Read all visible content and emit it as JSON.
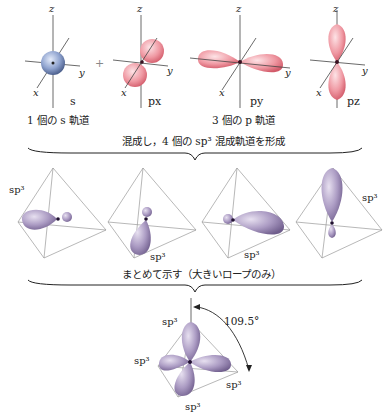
{
  "top_row": {
    "s_label": "s",
    "px_label": "px",
    "py_label": "py",
    "pz_label": "pz",
    "plus": "+",
    "axis_x": "x",
    "axis_y": "y",
    "axis_z": "z",
    "s_caption": "1 個の s 軌道",
    "p_caption": "3 個の p 軌道"
  },
  "brace1_caption": "混成し，4 個の sp³ 混成軌道を形成",
  "middle_row": {
    "labels": [
      "sp³",
      "sp³",
      "sp³",
      "sp³"
    ]
  },
  "brace2_caption": "まとめて示す（大きいロープのみ）",
  "bottom": {
    "labels": [
      "sp³",
      "sp³",
      "sp³",
      "sp³"
    ],
    "angle": "109.5°"
  },
  "colors": {
    "s_orbital": "#8fa3cf",
    "p_orbital": "#e9808c",
    "sp3_orbital": "#a595bd",
    "nucleus": "#3a1020"
  }
}
